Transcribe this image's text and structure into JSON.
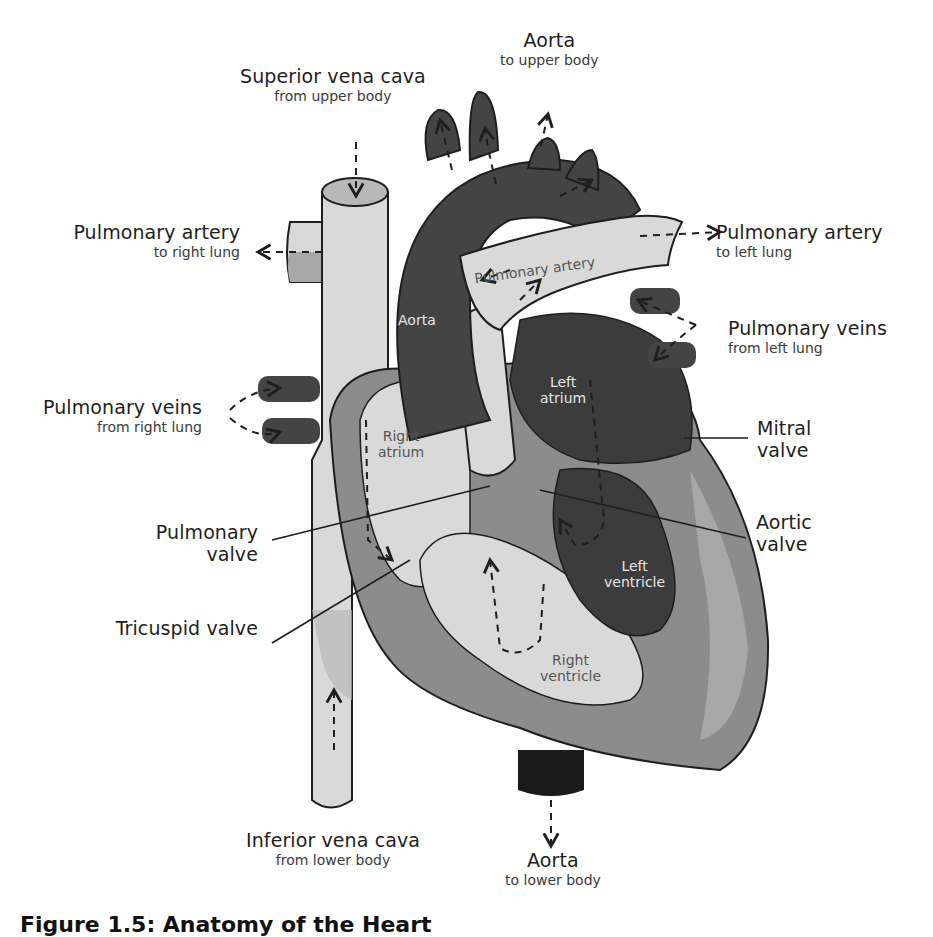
{
  "figure": {
    "caption": "Figure 1.5: Anatomy of the Heart",
    "colors": {
      "background": "#ffffff",
      "outline": "#1e1e1e",
      "vein_light": "#d9d9d9",
      "muscle_mid": "#8c8c8c",
      "wall_medium": "#a8a8a8",
      "chamber_dark": "#3c3c3c",
      "aorta_dark": "#444444",
      "aorta_bottom": "#1a1a1a"
    }
  },
  "external_labels": [
    {
      "id": "superior-vena-cava",
      "title": "Superior vena cava",
      "sub": "from upper body"
    },
    {
      "id": "aorta-top",
      "title": "Aorta",
      "sub": "to upper body"
    },
    {
      "id": "pulmonary-artery-right",
      "title": "Pulmonary artery",
      "sub": "to right lung"
    },
    {
      "id": "pulmonary-artery-left",
      "title": "Pulmonary artery",
      "sub": "to left lung"
    },
    {
      "id": "pulmonary-veins-left",
      "title": "Pulmonary veins",
      "sub": "from left lung"
    },
    {
      "id": "pulmonary-veins-right",
      "title": "Pulmonary veins",
      "sub": "from right lung"
    },
    {
      "id": "mitral-valve",
      "title": "Mitral valve"
    },
    {
      "id": "pulmonary-valve",
      "title": "Pulmonary valve"
    },
    {
      "id": "aortic-valve",
      "title": "Aortic valve"
    },
    {
      "id": "tricuspid-valve",
      "title": "Tricuspid valve"
    },
    {
      "id": "inferior-vena-cava",
      "title": "Inferior vena cava",
      "sub": "from lower body"
    },
    {
      "id": "aorta-bottom",
      "title": "Aorta",
      "sub": "to lower body"
    }
  ],
  "labels_split": {
    "mitral": [
      "Mitral",
      "valve"
    ],
    "pulmonary_valve": [
      "Pulmonary",
      "valve"
    ],
    "aortic": [
      "Aortic",
      "valve"
    ]
  },
  "internal_labels": {
    "aorta": "Aorta",
    "pulmonary_artery": "Pulmonary artery",
    "left_atrium": [
      "Left",
      "atrium"
    ],
    "right_atrium": [
      "Right",
      "atrium"
    ],
    "left_ventricle": [
      "Left",
      "ventricle"
    ],
    "right_ventricle": [
      "Right",
      "ventricle"
    ]
  }
}
